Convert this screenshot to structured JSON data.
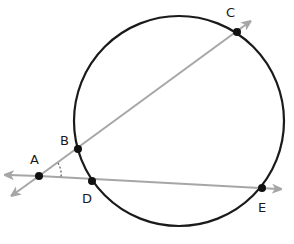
{
  "diagram": {
    "type": "circle-secants",
    "circle": {
      "cx": 179,
      "cy": 121,
      "r": 105,
      "stroke": "#1a1a1a"
    },
    "ray_color": "#a6a6a6",
    "point_color": "#111111",
    "points": [
      {
        "label": "A",
        "x": 39,
        "y": 176,
        "lx": 30,
        "ly": 164
      },
      {
        "label": "B",
        "x": 78,
        "y": 149,
        "lx": 60,
        "ly": 145
      },
      {
        "label": "C",
        "x": 237,
        "y": 32,
        "lx": 226,
        "ly": 17
      },
      {
        "label": "D",
        "x": 92,
        "y": 181,
        "lx": 82,
        "ly": 202
      },
      {
        "label": "E",
        "x": 262,
        "y": 188,
        "lx": 258,
        "ly": 211
      }
    ],
    "rays": [
      {
        "name": "line-AC",
        "from": [
          12,
          196
        ],
        "to": [
          250,
          22
        ]
      },
      {
        "name": "line-AE",
        "from": [
          5,
          175
        ],
        "to": [
          280,
          189
        ]
      }
    ],
    "angle_mark": {
      "at": "A",
      "style": "dashed-arc"
    }
  }
}
